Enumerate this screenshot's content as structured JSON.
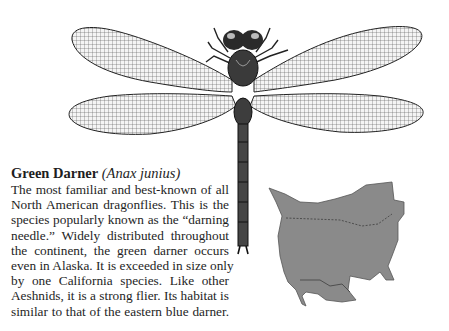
{
  "species": {
    "common_name": "Green Darner",
    "scientific_name": "(Anax junius)"
  },
  "description_lines": [
    "The most familiar and best-known of all",
    "North American dragonflies. This is the",
    "species popularly known as the “darning",
    "needle.” Widely distributed throughout",
    "the continent, the green darner occurs",
    "even in Alaska. It is exceeded in size only",
    "by one California species. Like other",
    "Aeshnids, it is a strong flier. Its habitat is",
    "similar to that of the eastern blue darner."
  ],
  "illustration": {
    "subject": "dragonfly-illustration"
  },
  "range_map": {
    "subject": "north-america-range-map",
    "fill": "#8a8a8a"
  }
}
